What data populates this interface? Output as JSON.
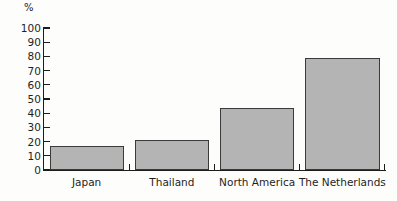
{
  "chart_data": {
    "type": "bar",
    "title": "",
    "xlabel": "",
    "ylabel": "%",
    "unit_caption": "%",
    "categories": [
      "Japan",
      "Thailand",
      "North America",
      "The Netherlands"
    ],
    "values": [
      17,
      21,
      44,
      79
    ],
    "ylim": [
      0,
      100
    ],
    "ytick_values": [
      0,
      10,
      20,
      30,
      40,
      50,
      60,
      70,
      80,
      90,
      100
    ],
    "ytick_labels": [
      "0",
      "10",
      "20",
      "30",
      "40",
      "50",
      "60",
      "70",
      "80",
      "90",
      "100"
    ],
    "grid": false,
    "legend": null,
    "series": [
      {
        "name": "",
        "values": [
          17,
          21,
          44,
          79
        ]
      }
    ],
    "bar_fill_color": "#b4b4b4",
    "bar_edge_color": "#3a3a3a",
    "axis_color": "#1c1c1c",
    "background_color": "#fdfdfc"
  }
}
